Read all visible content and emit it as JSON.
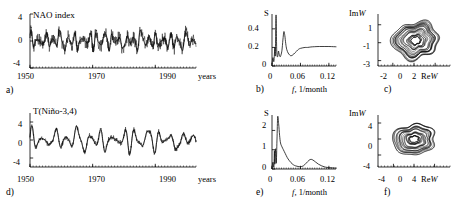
{
  "figure": {
    "panels": [
      {
        "id": "a",
        "letter": "a)",
        "series_title": "NAO index",
        "y_ticks": [
          "4",
          "0",
          "-4"
        ],
        "x_ticks": [
          "1950",
          "1970",
          "1990"
        ],
        "x_axis_label": "years"
      },
      {
        "id": "b",
        "letter": "b)",
        "y_axis_symbol": "S",
        "y_ticks": [
          "0.4",
          "0.2",
          "0"
        ],
        "x_ticks": [
          "0",
          "0.06",
          "0.12"
        ],
        "x_axis_label_sym": "f",
        "x_axis_label_rest": ", 1/month"
      },
      {
        "id": "c",
        "letter": "c)",
        "y_axis_label_pre": "Im",
        "y_axis_label_sym": "W",
        "y_ticks": [
          "1",
          "-1",
          "-3"
        ],
        "x_ticks": [
          "-2",
          "0",
          "2"
        ],
        "x_axis_label_pre": "Re",
        "x_axis_label_sym": "W"
      },
      {
        "id": "d",
        "letter": "d)",
        "series_title": "T(Niño-3,4)",
        "y_ticks": [
          "4",
          "0",
          "-4"
        ],
        "x_ticks": [
          "1950",
          "1970",
          "1990"
        ],
        "x_axis_label": "years"
      },
      {
        "id": "e",
        "letter": "e)",
        "y_axis_symbol": "S",
        "y_ticks": [
          "2",
          "1",
          "0"
        ],
        "x_ticks": [
          "0",
          "0.06",
          "0.12"
        ],
        "x_axis_label_sym": "f",
        "x_axis_label_rest": ", 1/month"
      },
      {
        "id": "f",
        "letter": "f)",
        "y_axis_label_pre": "Im",
        "y_axis_label_sym": "W",
        "y_ticks": [
          "4",
          "0",
          "-4"
        ],
        "x_ticks": [
          "-4",
          "0",
          "4"
        ],
        "x_axis_label_pre": "Re",
        "x_axis_label_sym": "W"
      }
    ]
  },
  "chart_data": [
    {
      "id": "a",
      "type": "line",
      "title": "NAO index",
      "xlabel": "years",
      "ylabel": "",
      "xlim": [
        1950,
        2003
      ],
      "ylim": [
        -4,
        4
      ],
      "x_ticks": [
        1950,
        1970,
        1990
      ],
      "y_ticks": [
        -4,
        0,
        4
      ],
      "grid": false,
      "series": [
        {
          "name": "NAO index (monthly, noisy)",
          "note": "dense high-frequency monthly record, amplitude mostly -3..3, occasional excursions to -4",
          "sampling_per_year": 12
        },
        {
          "name": "NAO index (smoothed envelope)",
          "note": "smoothed quasi-oscillatory overlay, period roughly 2-3 years, amplitude about -2..2",
          "sampling_per_year": 12
        }
      ]
    },
    {
      "id": "b",
      "type": "line",
      "title": "",
      "xlabel": "f, 1/month",
      "ylabel": "S",
      "xlim": [
        0,
        0.135
      ],
      "ylim": [
        0,
        0.56
      ],
      "x_ticks": [
        0,
        0.06,
        0.12
      ],
      "y_ticks": [
        0,
        0.2,
        0.4
      ],
      "grid": false,
      "x": [
        0.0,
        0.002,
        0.004,
        0.006,
        0.007,
        0.0085,
        0.01,
        0.012,
        0.0135,
        0.015,
        0.017,
        0.019,
        0.021,
        0.023,
        0.025,
        0.027,
        0.029,
        0.031,
        0.034,
        0.037,
        0.04,
        0.044,
        0.048,
        0.052,
        0.056,
        0.06,
        0.065,
        0.07,
        0.075,
        0.082,
        0.09,
        0.1,
        0.11,
        0.12,
        0.13,
        0.135
      ],
      "y": [
        0.02,
        0.09,
        0.05,
        0.2,
        0.12,
        0.55,
        0.16,
        0.1,
        0.16,
        0.13,
        0.1,
        0.12,
        0.17,
        0.28,
        0.37,
        0.33,
        0.24,
        0.18,
        0.14,
        0.12,
        0.11,
        0.12,
        0.14,
        0.16,
        0.18,
        0.19,
        0.196,
        0.2,
        0.2,
        0.205,
        0.208,
        0.21,
        0.21,
        0.21,
        0.208,
        0.207
      ]
    },
    {
      "id": "c",
      "type": "line",
      "title": "",
      "xlabel": "Re W",
      "ylabel": "Im W",
      "xlim": [
        -3.4,
        3.4
      ],
      "ylim": [
        -3.6,
        2.2
      ],
      "x_ticks": [
        -2,
        0,
        2
      ],
      "y_ticks": [
        -3,
        -1,
        1
      ],
      "grid": false,
      "note": "phase-plane trajectory: nested irregular concentric loops centred near (0.1, -0.8), outer loop radius about 1.9, inner loops shrinking to about 0.4"
    },
    {
      "id": "d",
      "type": "line",
      "title": "T(Niño-3,4)",
      "xlabel": "years",
      "ylabel": "",
      "xlim": [
        1950,
        2003
      ],
      "ylim": [
        -6,
        6
      ],
      "x_ticks": [
        1950,
        1970,
        1990
      ],
      "y_ticks": [
        -4,
        0,
        4
      ],
      "grid": false,
      "series": [
        {
          "name": "T(Niño-3,4) observed",
          "note": "quasi-periodic ENSO oscillation, dominant period about 3.5-4 years, amplitude -5..5",
          "sampling_per_year": 12
        },
        {
          "name": "T(Niño-3,4) model/smoothed",
          "note": "closely overlapping smooth reconstruction",
          "sampling_per_year": 12
        }
      ]
    },
    {
      "id": "e",
      "type": "line",
      "title": "",
      "xlabel": "f, 1/month",
      "ylabel": "S",
      "xlim": [
        0,
        0.135
      ],
      "ylim": [
        0,
        2.8
      ],
      "x_ticks": [
        0,
        0.06,
        0.12
      ],
      "y_ticks": [
        0,
        1,
        2
      ],
      "grid": false,
      "x": [
        0.0,
        0.002,
        0.004,
        0.005,
        0.006,
        0.0075,
        0.009,
        0.0105,
        0.012,
        0.014,
        0.016,
        0.018,
        0.021,
        0.024,
        0.028,
        0.032,
        0.036,
        0.04,
        0.045,
        0.05,
        0.055,
        0.06,
        0.066,
        0.072,
        0.078,
        0.082,
        0.086,
        0.092,
        0.098,
        0.105,
        0.112,
        0.12,
        0.128,
        0.135
      ],
      "y": [
        0.05,
        0.35,
        0.1,
        0.95,
        0.25,
        1.05,
        0.3,
        1.5,
        2.7,
        2.35,
        1.75,
        1.35,
        1.15,
        1.0,
        0.8,
        0.6,
        0.45,
        0.33,
        0.22,
        0.16,
        0.13,
        0.12,
        0.16,
        0.3,
        0.45,
        0.5,
        0.47,
        0.36,
        0.25,
        0.16,
        0.1,
        0.07,
        0.06,
        0.05
      ]
    },
    {
      "id": "f",
      "type": "line",
      "title": "",
      "xlabel": "Re W",
      "ylabel": "Im W",
      "xlim": [
        -7.0,
        7.0
      ],
      "ylim": [
        -7.0,
        6.0
      ],
      "x_ticks": [
        -4,
        0,
        4
      ],
      "y_ticks": [
        -4,
        0,
        4
      ],
      "grid": false,
      "note": "phase-plane trajectory: nested irregular concentric loops centred near (0, 0), outer loop radius about 3.6, inner loops shrinking to about 0.8"
    }
  ]
}
